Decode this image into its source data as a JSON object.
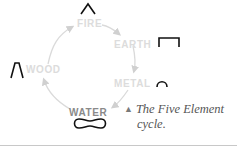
{
  "diagram": {
    "title": "Five Element cycle",
    "elements": [
      {
        "name": "FIRE",
        "symbol": "fire-symbol-caret"
      },
      {
        "name": "EARTH",
        "symbol": "earth-symbol-bracket"
      },
      {
        "name": "METAL",
        "symbol": "metal-symbol-arc"
      },
      {
        "name": "WATER",
        "symbol": "water-symbol-loop"
      },
      {
        "name": "WOOD",
        "symbol": "wood-symbol-peak"
      }
    ],
    "cycle_order": [
      "WOOD",
      "FIRE",
      "EARTH",
      "METAL",
      "WATER"
    ],
    "highlighted": "WATER"
  },
  "caption": {
    "marker": "▲",
    "line1": "The Five Element",
    "line2": "cycle."
  },
  "colors": {
    "faded_label": "#dcdcdc",
    "active_label": "#8a8a8a",
    "symbol_stroke": "#111111",
    "arrow": "#d8d8d8",
    "caption_text": "#555555",
    "rule": "#c8c8c8"
  }
}
